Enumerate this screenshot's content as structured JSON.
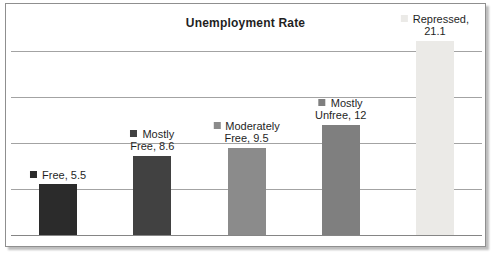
{
  "chart_data": {
    "type": "bar",
    "title": "Unemployment Rate",
    "categories": [
      "Free",
      "Mostly Free",
      "Moderately Free",
      "Mostly Unfree",
      "Repressed"
    ],
    "values": [
      5.5,
      8.6,
      9.5,
      12,
      21.1
    ],
    "data_labels": [
      [
        "Free, 5.5"
      ],
      [
        "Mostly",
        "Free, 8.6"
      ],
      [
        "Moderately",
        "Free, 9.5"
      ],
      [
        "Mostly",
        "Unfree, 12"
      ],
      [
        "Repressed,",
        "21.1"
      ]
    ],
    "bar_colors": [
      "#2b2b2b",
      "#414141",
      "#8b8b8b",
      "#7f7f7f",
      "#ebeae7"
    ],
    "xlabel": "",
    "ylabel": "",
    "ylim": [
      0,
      22
    ],
    "gridline_values": [
      5,
      10,
      15,
      20
    ],
    "grid": true,
    "legend_position": "none",
    "gridline_color": "#a3a3a3",
    "axis_color": "#858585",
    "frame_border_color": "#8f8f8f",
    "background_color": "#ffffff",
    "text_color": "#1f1f1f"
  }
}
